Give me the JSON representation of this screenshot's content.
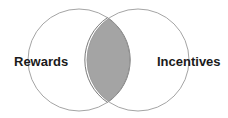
{
  "diagram": {
    "type": "venn",
    "sets": [
      {
        "label": "Rewards",
        "cx": 79,
        "cy": 60,
        "r": 51
      },
      {
        "label": "Incentives",
        "cx": 138,
        "cy": 60,
        "r": 51
      }
    ],
    "intersection": {
      "fill": "#a4a4a4",
      "stroke": "#555555"
    },
    "circle_stroke": "#9a9a9a",
    "background": "#ffffff"
  }
}
